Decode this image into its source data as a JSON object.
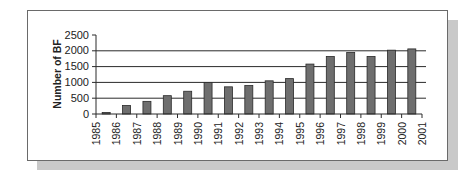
{
  "chart_data": {
    "type": "bar",
    "title": "",
    "xlabel": "",
    "ylabel": "Number of BF",
    "ylim": [
      0,
      2500
    ],
    "yticks": [
      0,
      500,
      1000,
      1500,
      2000,
      2500
    ],
    "xtick_labels": [
      "1985",
      "1986",
      "1987",
      "1988",
      "1989",
      "1990",
      "1991",
      "1992",
      "1993",
      "1994",
      "1995",
      "1996",
      "1997",
      "1998",
      "1999",
      "2000",
      "2001"
    ],
    "categories": [
      "1985",
      "1986",
      "1987",
      "1988",
      "1989",
      "1990",
      "1991",
      "1992",
      "1993",
      "1994",
      "1995",
      "1996",
      "1997",
      "1998",
      "1999",
      "2000"
    ],
    "values": [
      50,
      270,
      400,
      580,
      720,
      1000,
      860,
      900,
      1050,
      1120,
      1580,
      1820,
      1950,
      1820,
      2020,
      2060
    ],
    "grid": {
      "horizontal": true,
      "vertical": false
    },
    "legend": null,
    "colors": {
      "bar": "#6e6e6e",
      "bar_edge": "#2a2a2a",
      "grid": "#2a2a2a",
      "text": "#222222"
    }
  }
}
